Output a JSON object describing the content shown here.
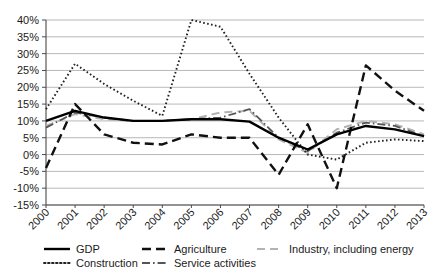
{
  "chart_data": {
    "type": "line",
    "title": "",
    "xlabel": "",
    "ylabel": "",
    "categories": [
      "2000",
      "2001",
      "2002",
      "2003",
      "2004",
      "2005",
      "2006",
      "2007",
      "2008",
      "2009",
      "2010",
      "2011",
      "2012",
      "2013"
    ],
    "ylim": [
      -15,
      40
    ],
    "ytick_labels": [
      "40%",
      "35%",
      "30%",
      "25%",
      "20%",
      "15%",
      "10%",
      "5%",
      "0%",
      "-5%",
      "-10%",
      "-15%"
    ],
    "ytick_values": [
      40,
      35,
      30,
      25,
      20,
      15,
      10,
      5,
      0,
      -5,
      -10,
      -15
    ],
    "grid": true,
    "legend_position": "bottom",
    "series": [
      {
        "name": "GDP",
        "style": "solid",
        "color": "#000000",
        "width": 2.4,
        "values": [
          10.0,
          13.0,
          11.0,
          10.0,
          10.0,
          10.5,
          10.5,
          9.8,
          5.0,
          1.5,
          6.0,
          8.5,
          7.5,
          5.5
        ]
      },
      {
        "name": "Agriculture",
        "style": "dashed",
        "color": "#111111",
        "width": 2.4,
        "values": [
          -4.0,
          15.0,
          6.0,
          3.5,
          3.0,
          6.0,
          5.0,
          5.0,
          -6.0,
          9.0,
          -10.0,
          26.5,
          19.0,
          13.0
        ]
      },
      {
        "name": "Industry, including energy",
        "style": "longdash",
        "color": "#b3b3b3",
        "width": 2.0,
        "values": [
          8.5,
          12.0,
          10.5,
          10.0,
          10.0,
          10.5,
          12.5,
          13.0,
          4.5,
          0.5,
          7.5,
          10.0,
          9.0,
          6.0
        ]
      },
      {
        "name": "Construction",
        "style": "dotted",
        "color": "#222222",
        "width": 1.9,
        "values": [
          13.5,
          27.0,
          21.0,
          16.0,
          11.5,
          40.0,
          38.0,
          24.0,
          11.0,
          0.0,
          -1.5,
          3.5,
          4.5,
          4.0
        ]
      },
      {
        "name": "Service activities",
        "style": "dashdot",
        "color": "#555555",
        "width": 1.8,
        "values": [
          8.0,
          12.5,
          11.0,
          10.0,
          10.0,
          10.5,
          11.0,
          13.5,
          5.0,
          1.0,
          6.5,
          9.5,
          8.5,
          5.5
        ]
      }
    ]
  },
  "legend": {
    "entries": [
      {
        "label": "GDP",
        "key": "gdp"
      },
      {
        "label": "Agriculture",
        "key": "agriculture"
      },
      {
        "label": "Industry, including energy",
        "key": "industry"
      },
      {
        "label": "Construction",
        "key": "construction"
      },
      {
        "label": "Service activities",
        "key": "service"
      }
    ]
  }
}
